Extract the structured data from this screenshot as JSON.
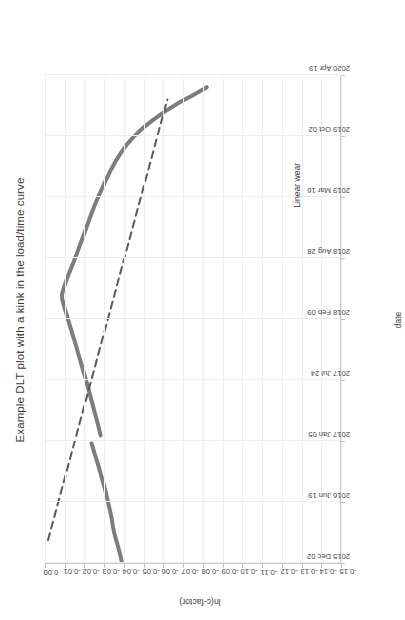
{
  "chart_data": {
    "type": "line",
    "title": "Example DLT plot with a kink in the load/time curve",
    "xlabel": "date",
    "ylabel": "ln(c-factor)",
    "orientation": "rotated-90-clockwise",
    "grid": true,
    "legend": "none",
    "xlim": [
      "2015 Dec 02",
      "2020 Apr 19"
    ],
    "xtick_labels": [
      "2015 Dec 02",
      "2016 Jun 19",
      "2017 Jan 05",
      "2017 Jul 24",
      "2018 Feb 09",
      "2018 Aug 28",
      "2019 Mar 16",
      "2019 Oct 02",
      "2020 Apr 19"
    ],
    "xtick_positions": [
      0.0,
      0.2,
      0.4,
      0.6,
      0.8,
      1.0,
      1.2,
      1.4,
      1.6
    ],
    "x_numeric_tick_labels": [
      "0.00",
      "0.20",
      "0.40",
      "0.60",
      "0.80",
      "1.00",
      "1.20",
      "1.40"
    ],
    "ylim": [
      -0.15,
      0.0
    ],
    "ytick_labels": [
      "0.00",
      "-0.01",
      "-0.02",
      "-0.03",
      "-0.04",
      "-0.05",
      "-0.06",
      "-0.07",
      "-0.08",
      "-0.09",
      "-0.10",
      "-0.11",
      "-0.12",
      "-0.13",
      "-0.14",
      "-0.15"
    ],
    "ytick_values": [
      0.0,
      -0.01,
      -0.02,
      -0.03,
      -0.04,
      -0.05,
      -0.06,
      -0.07,
      -0.08,
      -0.09,
      -0.1,
      -0.11,
      -0.12,
      -0.13,
      -0.14,
      -0.15
    ],
    "annotations": [
      {
        "text": "Linear wear",
        "x": 1.25,
        "y": -0.128
      }
    ],
    "series": [
      {
        "name": "measured c-factor",
        "style": "solid",
        "color": "#7d7d7d",
        "width": 4,
        "segments": [
          {
            "name": "segment-1-pre-kink",
            "x": [
              0.0,
              0.02,
              0.045,
              0.07,
              0.095,
              0.12,
              0.145,
              0.17,
              0.195,
              0.22,
              0.245,
              0.27,
              0.295,
              0.32,
              0.345,
              0.37,
              0.392
            ],
            "y": [
              -0.039,
              -0.0384,
              -0.0374,
              -0.0363,
              -0.0352,
              -0.0344,
              -0.0338,
              -0.033,
              -0.0321,
              -0.0312,
              -0.0303,
              -0.0292,
              -0.0281,
              -0.027,
              -0.0258,
              -0.0246,
              -0.0236
            ]
          },
          {
            "name": "segment-2-post-kink",
            "x": [
              0.418,
              0.445,
              0.47,
              0.498,
              0.525,
              0.552,
              0.58,
              0.608,
              0.635,
              0.662,
              0.69,
              0.718,
              0.745,
              0.772,
              0.8,
              0.826,
              0.848,
              0.866,
              0.88
            ],
            "y": [
              -0.0282,
              -0.0272,
              -0.0262,
              -0.025,
              -0.0239,
              -0.0228,
              -0.0216,
              -0.0204,
              -0.0192,
              -0.018,
              -0.0167,
              -0.0155,
              -0.0142,
              -0.0129,
              -0.0116,
              -0.0104,
              -0.0094,
              -0.0087,
              -0.0086
            ]
          },
          {
            "name": "segment-3-descending",
            "x": [
              0.88,
              0.905,
              0.93,
              0.958,
              0.985,
              1.012,
              1.04,
              1.068,
              1.095,
              1.122,
              1.15,
              1.178,
              1.205,
              1.232,
              1.26,
              1.288,
              1.315,
              1.342,
              1.37,
              1.398,
              1.425,
              1.452,
              1.48,
              1.508,
              1.535,
              1.56
            ],
            "y": [
              -0.0086,
              -0.0097,
              -0.011,
              -0.0127,
              -0.0144,
              -0.016,
              -0.0176,
              -0.0192,
              -0.0207,
              -0.0222,
              -0.0238,
              -0.0255,
              -0.0273,
              -0.0292,
              -0.0312,
              -0.0333,
              -0.0356,
              -0.0382,
              -0.0412,
              -0.045,
              -0.0494,
              -0.0546,
              -0.0607,
              -0.0676,
              -0.0754,
              -0.082
            ]
          }
        ]
      },
      {
        "name": "Linear wear",
        "style": "dashed",
        "color": "#595959",
        "width": 2,
        "x": [
          0.075,
          1.52
        ],
        "y": [
          -0.0015,
          -0.062
        ]
      }
    ]
  },
  "chart_meta": {
    "axis_color": "#c8c8c8",
    "grid_color": "#ededed",
    "text_color": "#3b3b3b",
    "tick_text_color": "#464646",
    "background": "#ffffff"
  }
}
